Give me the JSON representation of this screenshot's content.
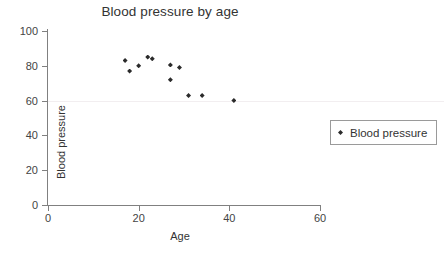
{
  "chart_data": {
    "type": "scatter",
    "title": "Blood pressure by age",
    "xlabel": "Age",
    "ylabel": "Blood pressure",
    "xlim": [
      0,
      60
    ],
    "ylim": [
      0,
      100
    ],
    "xticks": [
      0,
      20,
      40,
      60
    ],
    "yticks": [
      0,
      20,
      40,
      60,
      80,
      100
    ],
    "grid": "horizontal-faint-at-60",
    "legend_position": "right",
    "series": [
      {
        "name": "Blood pressure",
        "color": "#2b2b2b",
        "marker": "diamond",
        "points": [
          {
            "x": 17,
            "y": 83
          },
          {
            "x": 18,
            "y": 77
          },
          {
            "x": 20,
            "y": 80
          },
          {
            "x": 22,
            "y": 85
          },
          {
            "x": 23,
            "y": 84
          },
          {
            "x": 27,
            "y": 80.5
          },
          {
            "x": 27,
            "y": 72
          },
          {
            "x": 29,
            "y": 79
          },
          {
            "x": 31,
            "y": 63
          },
          {
            "x": 34,
            "y": 63
          },
          {
            "x": 41,
            "y": 60
          }
        ]
      }
    ]
  },
  "legend": {
    "entries": [
      {
        "label": "Blood pressure"
      }
    ]
  },
  "colors": {
    "background": "#ffffff",
    "axis": "#808080",
    "marker": "#2b2b2b",
    "text": "#333333",
    "gridline": "#f2eef0"
  }
}
